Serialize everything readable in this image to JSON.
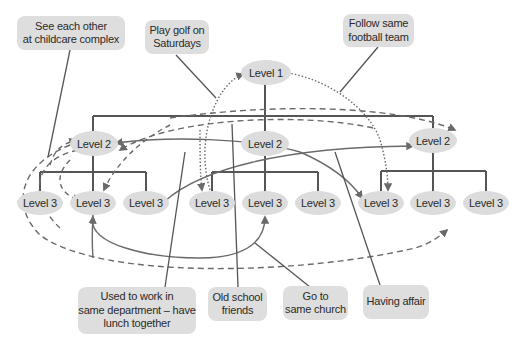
{
  "diagram": {
    "type": "organization-hierarchy-with-informal-relationships",
    "colors": {
      "node_fill": "#dcdcdc",
      "callout_fill": "#dedede",
      "line": "#5a5a5a",
      "text": "#2a2a2a"
    },
    "nodes": {
      "level1": "Level 1",
      "level2": [
        "Level 2",
        "Level 2",
        "Level 2"
      ],
      "level3": [
        "Level 3",
        "Level 3",
        "Level 3",
        "Level 3",
        "Level 3",
        "Level 3",
        "Level 3",
        "Level 3",
        "Level 3"
      ]
    },
    "callouts": {
      "childcare": "See each other\nat childcare complex",
      "golf": "Play golf on\nSaturdays",
      "football": "Follow same\nfootball team",
      "department": "Used to work in\nsame department – have\nlunch together",
      "school": "Old school\nfriends",
      "church": "Go to\nsame church",
      "affair": "Having affair"
    },
    "relationships": [
      {
        "label": "See each other at childcare complex",
        "style": "dashed",
        "connects": [
          "Level 2 (left)",
          "Level 3 (left-middle)"
        ]
      },
      {
        "label": "Play golf on Saturdays",
        "style": "dotted",
        "connects": [
          "Level 1",
          "Level 3 (right-left)"
        ]
      },
      {
        "label": "Follow same football team",
        "style": "dotted",
        "connects": [
          "Level 1",
          "Level 3 (right-left)"
        ]
      },
      {
        "label": "Used to work in same department – have lunch together",
        "style": "dashed",
        "connects": [
          "Level 2 (right)",
          "Level 3 (left-middle)"
        ]
      },
      {
        "label": "Old school friends",
        "style": "solid",
        "connects": [
          "Level 2 (left)",
          "Level 3 (right-left)"
        ]
      },
      {
        "label": "Go to same church",
        "style": "solid",
        "connects": [
          "Level 3 (left-middle)",
          "Level 3 (center)"
        ]
      },
      {
        "label": "Having affair",
        "style": "solid",
        "connects": [
          "Level 3 (left-right)",
          "Level 2 (right)"
        ]
      }
    ]
  }
}
